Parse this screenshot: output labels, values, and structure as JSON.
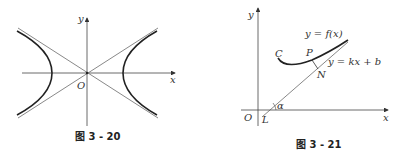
{
  "figures": [
    {
      "id": "fig-3-20",
      "caption": "图 3 - 20",
      "axes": {
        "x_label": "x",
        "y_label": "y",
        "origin_label": "O"
      },
      "elements": [
        "hyperbola (two branches, left and right)",
        "two asymptotes through origin"
      ]
    },
    {
      "id": "fig-3-21",
      "caption": "图 3 - 21",
      "axes": {
        "x_label": "x",
        "y_label": "y",
        "origin_label": "O"
      },
      "labels": {
        "curve_name": "C",
        "curve_eq": "y = f(x)",
        "line_eq": "y = kx + b",
        "point_p": "P",
        "point_n": "N",
        "point_l": "L",
        "angle": "α"
      }
    }
  ]
}
